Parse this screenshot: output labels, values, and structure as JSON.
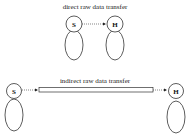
{
  "diagram": {
    "top": {
      "title": "direct raw data transfer",
      "source_label": "S",
      "target_label": "H"
    },
    "bottom": {
      "title": "indirect raw data transfer",
      "source_label": "S",
      "target_label": "H"
    },
    "colors": {
      "stroke": "#333333",
      "background": "#ffffff"
    }
  }
}
